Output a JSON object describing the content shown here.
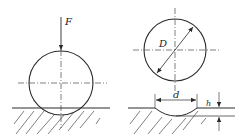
{
  "figure": {
    "left_panel": {
      "description": "Ball pressed onto surface by force",
      "force_label": "F"
    },
    "right_panel": {
      "description": "Ball and resulting indentation",
      "diameter_label": "D",
      "indent_diameter_label": "d",
      "indent_depth_label": "h"
    }
  },
  "colors": {
    "line": "#2a2a2a",
    "background": "#ffffff"
  }
}
